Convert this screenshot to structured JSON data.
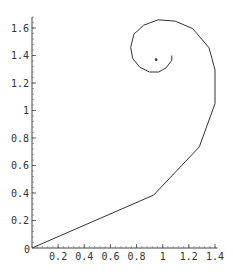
{
  "chart_data": {
    "type": "line",
    "title": "",
    "xlabel": "",
    "ylabel": "",
    "xlim": [
      0,
      1.42
    ],
    "ylim": [
      0,
      1.68
    ],
    "grid": false,
    "legend": null,
    "x_ticks": [
      "0",
      "0.2",
      "0.4",
      "0.6",
      "0.8",
      "1",
      "1.2",
      "1.4"
    ],
    "y_ticks": [
      "0.2",
      "0.4",
      "0.6",
      "0.8",
      "1",
      "1.2",
      "1.4",
      "1.6"
    ],
    "origin_label": "0",
    "series": [
      {
        "name": "spiral",
        "color": "#333333",
        "points": [
          [
            0.0,
            0.0
          ],
          [
            0.93,
            0.385
          ],
          [
            1.28,
            0.735
          ],
          [
            1.4,
            1.05
          ],
          [
            1.4,
            1.295
          ],
          [
            1.355,
            1.455
          ],
          [
            1.23,
            1.595
          ],
          [
            1.095,
            1.65
          ],
          [
            0.965,
            1.66
          ],
          [
            0.855,
            1.62
          ],
          [
            0.78,
            1.555
          ],
          [
            0.755,
            1.46
          ],
          [
            0.77,
            1.38
          ],
          [
            0.825,
            1.315
          ],
          [
            0.9,
            1.28
          ],
          [
            0.97,
            1.28
          ],
          [
            1.025,
            1.31
          ],
          [
            1.07,
            1.365
          ],
          [
            1.07,
            1.4
          ]
        ]
      }
    ],
    "annotations": [
      {
        "type": "point",
        "x": 0.95,
        "y": 1.37,
        "label": ""
      }
    ]
  }
}
